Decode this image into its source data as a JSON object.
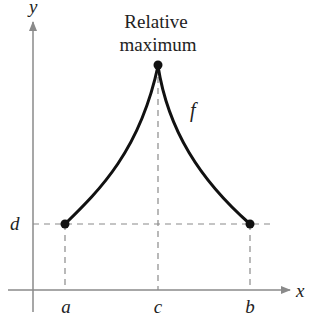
{
  "title": "Relative maximum",
  "annotation": {
    "line1": "Relative",
    "line2": "maximum"
  },
  "function_label": "f",
  "axes": {
    "x_label": "x",
    "y_label": "y"
  },
  "tick_labels": {
    "a": "a",
    "c": "c",
    "b": "b",
    "d": "d"
  },
  "points": [
    {
      "name": "left-endpoint",
      "x_label": "a",
      "y_label": "d"
    },
    {
      "name": "relative-maximum",
      "x_label": "c"
    },
    {
      "name": "right-endpoint",
      "x_label": "b",
      "y_label": "d"
    }
  ],
  "colors": {
    "curve": "#111111",
    "axis": "#8a8a8a",
    "dashed": "#8a8a8a",
    "text": "#222222"
  }
}
